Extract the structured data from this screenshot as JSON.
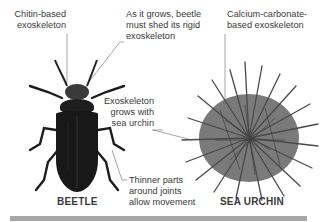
{
  "diagram": {
    "subjects": [
      {
        "name": "BEETLE",
        "annotations": [
          {
            "id": "chitin",
            "text_lines": [
              "Chitin-based",
              "exoskeleton"
            ]
          },
          {
            "id": "shed",
            "text_lines": [
              "As it grows, beetle",
              "must shed its rigid",
              "exoskeleton"
            ]
          },
          {
            "id": "joints",
            "text_lines": [
              "Thinner parts",
              "around joints",
              "allow movement"
            ]
          }
        ]
      },
      {
        "name": "SEA URCHIN",
        "annotations": [
          {
            "id": "calcium",
            "text_lines": [
              "Calcium-carbonate-",
              "based exoskeleton"
            ]
          },
          {
            "id": "grows",
            "text_lines": [
              "Exoskeleton",
              "grows with",
              "sea urchin"
            ]
          }
        ]
      }
    ],
    "colors": {
      "beetle_body": "#1c1c1c",
      "beetle_head": "#3a3a3a",
      "urchin_body": "#7a7a7a",
      "urchin_spines": "#4a4a4a",
      "leader_lines": "#6a6a6a",
      "bottom_bar": "#a6a6a6"
    }
  }
}
